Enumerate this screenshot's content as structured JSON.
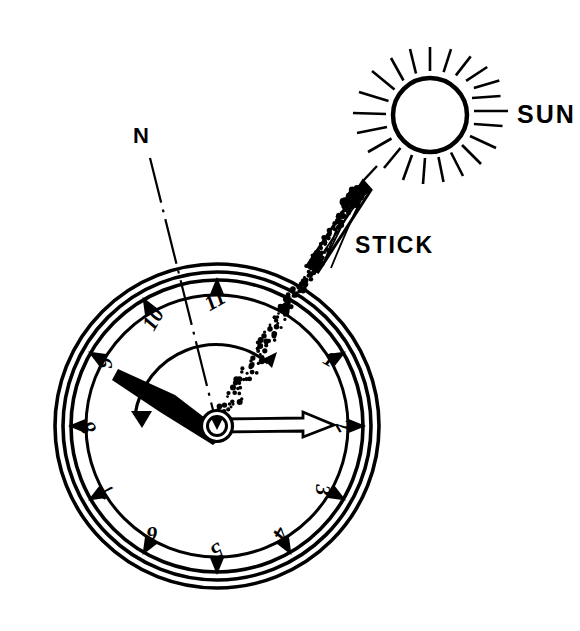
{
  "figure": {
    "domain_type": "diagram",
    "background_color": "#ffffff",
    "ink_color": "#000000"
  },
  "labels": {
    "sun": "SUN",
    "stick": "STICK",
    "north": "N"
  },
  "sun": {
    "name": "sun-symbol",
    "center_x": 430,
    "center_y": 115,
    "radius": 37,
    "ray_count": 20,
    "ray_inner": 44,
    "ray_outer": 68,
    "stroke_width": 4
  },
  "stick": {
    "name": "stick-shadow-caster",
    "tip_x": 362,
    "tip_y": 183,
    "base_x": 311,
    "base_y": 266,
    "half_width": 7
  },
  "sun_ray": {
    "name": "dotted-sun-shadow-line",
    "from_x": 217,
    "from_y": 425,
    "to_x": 362,
    "to_y": 183,
    "style": "dotted",
    "dot_radius": 2.1
  },
  "watch": {
    "name": "pocket-watch",
    "center_x": 217,
    "center_y": 426,
    "rings": [
      {
        "name": "case-outer",
        "radius": 162,
        "stroke": 3.5
      },
      {
        "name": "case-inner",
        "radius": 154,
        "stroke": 3.5
      },
      {
        "name": "bezel-outer",
        "radius": 146,
        "stroke": 3.5
      },
      {
        "name": "dial-edge",
        "radius": 131,
        "stroke": 3.0
      }
    ],
    "hub": {
      "name": "hand-hub",
      "outer_radius": 15,
      "mid_radius": 10,
      "inner_radius": 5
    },
    "numerals": [
      {
        "value": "1",
        "x": 329,
        "y": 361,
        "rotate": 30
      },
      {
        "value": "2",
        "x": 342,
        "y": 427,
        "rotate": 60
      },
      {
        "value": "3",
        "x": 321,
        "y": 490,
        "rotate": 90
      },
      {
        "value": "4",
        "x": 279,
        "y": 533,
        "rotate": 120
      },
      {
        "value": "5",
        "x": 216,
        "y": 549,
        "rotate": 150
      },
      {
        "value": "6",
        "x": 152,
        "y": 532,
        "rotate": 180
      },
      {
        "value": "7",
        "x": 107,
        "y": 490,
        "rotate": 210
      },
      {
        "value": "8",
        "x": 90,
        "y": 427,
        "rotate": 240
      },
      {
        "value": "9",
        "x": 107,
        "y": 363,
        "rotate": 270
      },
      {
        "value": "10",
        "x": 155,
        "y": 320,
        "rotate": 300
      },
      {
        "value": "11",
        "x": 216,
        "y": 302,
        "rotate": 330
      }
    ],
    "hour_markers_degrees": [
      0,
      30,
      60,
      90,
      120,
      150,
      180,
      210,
      240,
      270,
      300,
      330
    ],
    "hour_hand": {
      "name": "hour-hand",
      "angle_deg": 262,
      "tip_x": 120,
      "tip_y": 371,
      "length": 100,
      "reads": "9 o'clock"
    },
    "minute_hand": {
      "name": "minute-hand",
      "angle_deg": 0,
      "tip_x": 334,
      "tip_y": 425,
      "length": 117,
      "style": "outlined-arrow"
    }
  },
  "north_line": {
    "name": "north-bisector-line",
    "from_x": 150,
    "from_y": 158,
    "to_x": 217,
    "to_y": 426,
    "style": "chain-dash-dot"
  },
  "angle_arc": {
    "name": "bisected-angle-arc",
    "radius": 82,
    "start_label": "hour-hand",
    "end_label": "sun-direction",
    "arrow_at": "hour-hand-side"
  }
}
